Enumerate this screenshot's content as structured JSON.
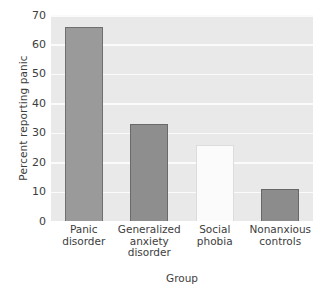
{
  "chart_data": {
    "type": "bar",
    "title": "",
    "xlabel": "Group",
    "ylabel": "Percent reporting panic",
    "categories": [
      "Panic disorder",
      "Generalized anxiety disorder",
      "Social phobia",
      "Nonanxious controls"
    ],
    "category_lines": [
      [
        "Panic",
        "disorder"
      ],
      [
        "Generalized",
        "anxiety",
        "disorder"
      ],
      [
        "Social",
        "phobia"
      ],
      [
        "Nonanxious",
        "controls"
      ]
    ],
    "values": [
      66,
      33,
      26,
      11
    ],
    "ylim": [
      0,
      70
    ],
    "yticks": [
      0,
      10,
      20,
      30,
      40,
      50,
      60,
      70
    ],
    "ytick_labels": [
      "0",
      "10",
      "20",
      "30",
      "40",
      "50",
      "60",
      "70"
    ],
    "grid": true,
    "grid_axis": "y",
    "legend": "none",
    "bar_colors": [
      "#9a9a9a",
      "#8e8e8e",
      "#fbfbfb",
      "#8c8c8c"
    ],
    "bar_edge_colors": [
      "#6f6f6f",
      "#6a6a6a",
      "#dcdcdc",
      "#676767"
    ],
    "plot_background": "#e9e9e9",
    "gridline_color": "#fbfbfb",
    "figure_background": "#ffffff"
  }
}
